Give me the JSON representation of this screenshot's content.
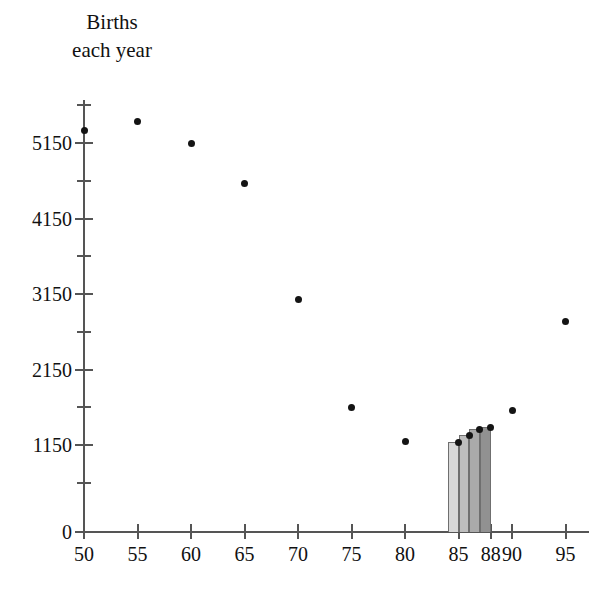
{
  "chart_data": {
    "type": "scatter",
    "xlabel": "",
    "ylabel": "",
    "xlim": [
      50,
      97
    ],
    "ylim": [
      0,
      5650
    ],
    "grid": false,
    "legend": null,
    "x_ticks": [
      50,
      55,
      60,
      65,
      70,
      75,
      80,
      85,
      88,
      90,
      95
    ],
    "x_tick_labels": [
      "50",
      "55",
      "60",
      "65",
      "70",
      "75",
      "80",
      "85",
      "88",
      "90",
      "95"
    ],
    "y_ticks": [
      0,
      1150,
      2150,
      3150,
      4150,
      5150
    ],
    "y_tick_labels": [
      "0",
      "1150",
      "2150",
      "3150",
      "4150",
      "5150"
    ],
    "y_minor_ticks": [
      650,
      1650,
      2650,
      3650,
      4650,
      5650
    ],
    "series": [
      {
        "name": "Births each year",
        "marker": "circle",
        "color": "#141414",
        "points": [
          {
            "x": 50,
            "y": 5320
          },
          {
            "x": 55,
            "y": 5440
          },
          {
            "x": 60,
            "y": 5150
          },
          {
            "x": 65,
            "y": 4620
          },
          {
            "x": 70,
            "y": 3080
          },
          {
            "x": 75,
            "y": 1650
          },
          {
            "x": 80,
            "y": 1200
          },
          {
            "x": 85,
            "y": 1190
          },
          {
            "x": 86,
            "y": 1280
          },
          {
            "x": 87,
            "y": 1360
          },
          {
            "x": 88,
            "y": 1390
          },
          {
            "x": 90,
            "y": 1610
          },
          {
            "x": 95,
            "y": 2790
          }
        ]
      }
    ],
    "bars": [
      {
        "x": 85,
        "value": 1190,
        "color": "#d8d8d8"
      },
      {
        "x": 86,
        "value": 1280,
        "color": "#bdbdbd"
      },
      {
        "x": 87,
        "value": 1360,
        "color": "#aaaaaa"
      },
      {
        "x": 88,
        "value": 1390,
        "color": "#919191"
      }
    ]
  },
  "title": {
    "line1": "Births",
    "line2": "each year"
  },
  "axes": {
    "y_labels": [
      "5150",
      "4150",
      "3150",
      "2150",
      "1150",
      "0"
    ],
    "x_labels": [
      "50",
      "55",
      "60",
      "65",
      "70",
      "75",
      "80",
      "85",
      "88",
      "90",
      "95"
    ]
  },
  "colors": {
    "axis": "#555555",
    "marker": "#141414",
    "bar_1": "#d8d8d8",
    "bar_2": "#bdbdbd",
    "bar_3": "#aaaaaa",
    "bar_4": "#919191",
    "bar_outline": "#6f6f6f"
  }
}
